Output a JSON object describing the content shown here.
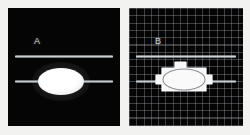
{
  "figure": {
    "background_color": "#f2f2f0",
    "panel_background_color": "#050505"
  },
  "panels": [
    {
      "id": "a",
      "label": "A",
      "label_color": "#cfcfcf",
      "has_grid": false,
      "description": "Dark-field image: two horizontal bright bars with a solid bright filled ellipse centred on the lower bar",
      "features": {
        "upper_bar_label": "upper horizontal bar",
        "lower_bar_label": "lower horizontal bar",
        "ellipse_label": "filled bright ellipse"
      }
    },
    {
      "id": "b",
      "label": "B",
      "label_color": "#cfcfcf",
      "has_grid": true,
      "grid_spacing_px": 7.3,
      "grid_color": "#bec3c8",
      "description": "Same field with square measurement grid overlay; the ellipse is drawn as an outline inside a white polygonal mask with tabs on top, left and right",
      "features": {
        "upper_bar_label": "upper horizontal bar",
        "lower_bar_label": "lower horizontal bar",
        "ellipse_label": "ellipse outline",
        "mask_label": "polygonal mask outline"
      }
    }
  ],
  "colors": {
    "bar_highlight": "#d6dadc",
    "ellipse_fill": "#ffffff",
    "mask_stroke": "#ffffff",
    "mask_fill": "#f5f5f5"
  }
}
